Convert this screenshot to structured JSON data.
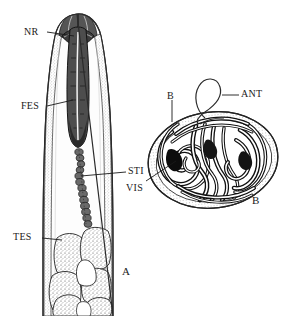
{
  "figure": {
    "type": "anatomical-line-drawing",
    "background_color": "#ffffff",
    "ink_color": "#1a1a1a",
    "panels": [
      {
        "caption": "A",
        "description": "longitudinal view of anterior body region"
      },
      {
        "caption": "B",
        "description": "encysted coiled larva"
      }
    ]
  },
  "labels": {
    "nerve_ring": "NR",
    "esophagus": "FES",
    "intestine": "STI",
    "testis": "TES",
    "anterior_end": "ANT",
    "cyst_wall_upper": "B",
    "viscera": "VIS"
  },
  "captions": {
    "panel_a": "A",
    "panel_b": "B"
  }
}
